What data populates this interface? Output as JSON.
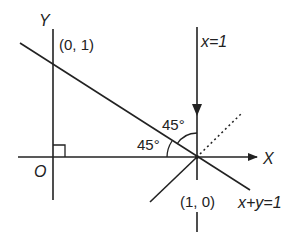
{
  "diagram": {
    "axes": {
      "x_label": "X",
      "y_label": "Y",
      "origin_label": "O"
    },
    "points": {
      "y_intercept": "(0, 1)",
      "x_intercept": "(1, 0)"
    },
    "lines": {
      "vertical_line_label": "x=1",
      "diagonal_line_label": "x+y=1"
    },
    "angles": {
      "upper_angle": "45°",
      "lower_angle": "45°"
    },
    "colors": {
      "ink": "#222222",
      "background": "#ffffff"
    }
  }
}
